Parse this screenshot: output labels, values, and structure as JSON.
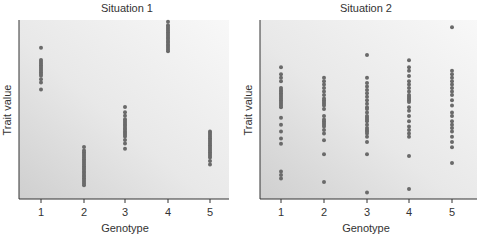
{
  "chart_data": [
    {
      "type": "scatter",
      "title": "Situation 1",
      "xlabel": "Genotype",
      "ylabel": "Trait value",
      "categories": [
        "1",
        "2",
        "3",
        "4",
        "5"
      ],
      "ylim": [
        0,
        100
      ],
      "grid": false,
      "legend": null,
      "series": [
        {
          "name": "Genotype 1",
          "x": 1,
          "values": [
            84,
            77,
            76,
            75,
            74,
            73,
            72,
            71,
            70,
            69,
            68,
            66,
            64,
            60
          ]
        },
        {
          "name": "Genotype 2",
          "x": 2,
          "values": [
            27,
            25,
            24,
            23,
            22,
            21,
            20,
            19,
            18,
            17,
            16,
            15,
            14,
            13,
            12,
            11,
            10,
            9,
            8,
            7,
            6,
            5
          ]
        },
        {
          "name": "Genotype 3",
          "x": 3,
          "values": [
            50,
            47,
            45,
            43,
            42,
            41,
            40,
            39,
            38,
            37,
            36,
            35,
            34,
            33,
            31,
            29,
            26
          ]
        },
        {
          "name": "Genotype 4",
          "x": 4,
          "values": [
            99,
            97,
            96,
            95,
            94,
            93,
            92,
            91,
            90,
            89,
            88,
            87,
            86,
            85,
            84,
            83,
            82
          ]
        },
        {
          "name": "Genotype 5",
          "x": 5,
          "values": [
            36,
            35,
            34,
            33,
            32,
            31,
            30,
            29,
            28,
            27,
            26,
            25,
            24,
            23,
            22,
            21,
            19,
            17
          ]
        }
      ]
    },
    {
      "type": "scatter",
      "title": "Situation 2",
      "xlabel": "Genotype",
      "ylabel": "Trait value",
      "categories": [
        "1",
        "2",
        "3",
        "4",
        "5"
      ],
      "ylim": [
        0,
        100
      ],
      "grid": false,
      "legend": null,
      "series": [
        {
          "name": "Genotype 1",
          "x": 1,
          "values": [
            74,
            70,
            68,
            66,
            62,
            61,
            60,
            59,
            58,
            57,
            56,
            55,
            54,
            53,
            52,
            51,
            45,
            41,
            37,
            33,
            30,
            14,
            12,
            10
          ]
        },
        {
          "name": "Genotype 2",
          "x": 2,
          "values": [
            68,
            66,
            64,
            62,
            60,
            58,
            56,
            55,
            54,
            53,
            52,
            50,
            46,
            44,
            43,
            42,
            41,
            40,
            38,
            36,
            32,
            24,
            8
          ]
        },
        {
          "name": "Genotype 3",
          "x": 3,
          "values": [
            81,
            68,
            65,
            63,
            61,
            59,
            57,
            55,
            53,
            51,
            50,
            48,
            46,
            45,
            44,
            43,
            41,
            39,
            38,
            37,
            36,
            34,
            31,
            24,
            2
          ]
        },
        {
          "name": "Genotype 4",
          "x": 4,
          "values": [
            78,
            74,
            72,
            69,
            66,
            64,
            62,
            60,
            58,
            57,
            56,
            55,
            54,
            51,
            49,
            46,
            43,
            40,
            38,
            36,
            34,
            23,
            4
          ]
        },
        {
          "name": "Genotype 5",
          "x": 5,
          "values": [
            97,
            72,
            70,
            68,
            66,
            64,
            62,
            60,
            58,
            55,
            52,
            48,
            46,
            43,
            41,
            39,
            37,
            34,
            31,
            28,
            19
          ]
        }
      ]
    }
  ],
  "panels": [
    {
      "title": "Situation 1",
      "xlabel": "Genotype",
      "ylabel": "Trait value",
      "ticks": [
        "1",
        "2",
        "3",
        "4",
        "5"
      ]
    },
    {
      "title": "Situation 2",
      "xlabel": "Genotype",
      "ylabel": "Trait value",
      "ticks": [
        "1",
        "2",
        "3",
        "4",
        "5"
      ]
    }
  ],
  "colors": {
    "point": "#6a6a6a",
    "axis": "#333333",
    "bg_light": "#f7f7f7",
    "bg_dark": "#d2d2d2"
  }
}
